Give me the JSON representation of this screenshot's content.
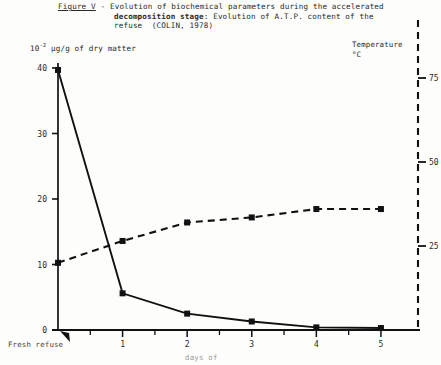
{
  "caption": {
    "figure_label": "Figure V",
    "line1_rest": " - Evolution of biochemical parameters during the accelerated",
    "line2_bold": "decomposition stage",
    "line2_rest": ": Evolution of A.T.P. content of the",
    "line3": "refuse  (COLIN, 1978)"
  },
  "axis_titles": {
    "left_prefix": "10",
    "left_exponent": "-2",
    "left_rest": " µg/g of dry matter",
    "right_line1": "Temperature",
    "right_line2": "°C",
    "x_title": "days of",
    "x_origin_label": "Fresh refuse"
  },
  "chart_data": {
    "type": "line",
    "title": "Figure V - Evolution of biochemical parameters during the accelerated decomposition stage: Evolution of A.T.P. content of the refuse (COLIN, 1978)",
    "xlabel": "days of",
    "ylabel": "10-2 µg/g of dry matter",
    "y2label": "Temperature °C",
    "grid": false,
    "legend": "none",
    "categories": [
      "Fresh refuse",
      "1",
      "2",
      "3",
      "4",
      "5"
    ],
    "x": [
      0,
      1,
      2,
      3,
      4,
      5
    ],
    "xlim": [
      0,
      5.45
    ],
    "ylim": [
      0,
      42
    ],
    "y2lim": [
      0,
      83
    ],
    "yticks": [
      0,
      10,
      20,
      30,
      40
    ],
    "y2ticks": [
      25,
      50,
      75
    ],
    "xticks": [
      "Fresh refuse",
      "1",
      "2",
      "3",
      "4",
      "5"
    ],
    "series": [
      {
        "name": "A.T.P. content",
        "axis": "left",
        "style": "solid",
        "marker": "square",
        "color": "#111111",
        "values": [
          39.7,
          5.6,
          2.5,
          1.3,
          0.4,
          0.3
        ]
      },
      {
        "name": "Temperature",
        "axis": "right",
        "style": "dashed",
        "marker": "square",
        "color": "#111111",
        "values": [
          20.0,
          26.5,
          32.0,
          33.5,
          36.0,
          36.0
        ]
      }
    ]
  }
}
